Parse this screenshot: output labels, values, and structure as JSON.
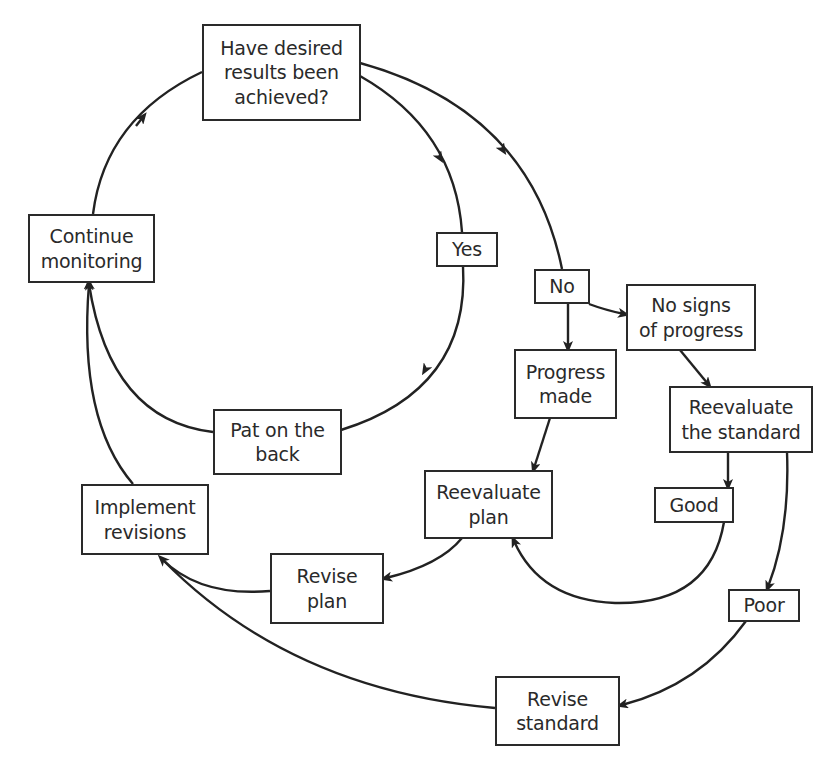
{
  "diagram": {
    "type": "flowchart",
    "nodes": {
      "question": {
        "label": "Have desired\nresults been\nachieved?"
      },
      "continue": {
        "label": "Continue\nmonitoring"
      },
      "yes": {
        "label": "Yes"
      },
      "no": {
        "label": "No"
      },
      "no_signs": {
        "label": "No signs\nof progress"
      },
      "progress_made": {
        "label": "Progress\nmade"
      },
      "reeval_standard": {
        "label": "Reevaluate\nthe standard"
      },
      "pat": {
        "label": "Pat on the\nback"
      },
      "reeval_plan": {
        "label": "Reevaluate\nplan"
      },
      "good": {
        "label": "Good"
      },
      "implement": {
        "label": "Implement\nrevisions"
      },
      "revise_plan": {
        "label": "Revise\nplan"
      },
      "poor": {
        "label": "Poor"
      },
      "revise_standard": {
        "label": "Revise\nstandard"
      }
    },
    "edges": [
      {
        "from": "continue",
        "to": "question"
      },
      {
        "from": "question",
        "to": "yes"
      },
      {
        "from": "question",
        "to": "no"
      },
      {
        "from": "yes",
        "to": "pat"
      },
      {
        "from": "pat",
        "to": "continue"
      },
      {
        "from": "no",
        "to": "progress_made"
      },
      {
        "from": "no",
        "to": "no_signs"
      },
      {
        "from": "no_signs",
        "to": "reeval_standard"
      },
      {
        "from": "progress_made",
        "to": "reeval_plan"
      },
      {
        "from": "reeval_standard",
        "to": "good"
      },
      {
        "from": "reeval_standard",
        "to": "poor"
      },
      {
        "from": "good",
        "to": "reeval_plan"
      },
      {
        "from": "reeval_plan",
        "to": "revise_plan"
      },
      {
        "from": "revise_plan",
        "to": "implement"
      },
      {
        "from": "poor",
        "to": "revise_standard"
      },
      {
        "from": "revise_standard",
        "to": "implement"
      },
      {
        "from": "implement",
        "to": "continue"
      }
    ],
    "colors": {
      "stroke": "#222222",
      "text": "#2a2a2a",
      "background": "#ffffff"
    }
  }
}
